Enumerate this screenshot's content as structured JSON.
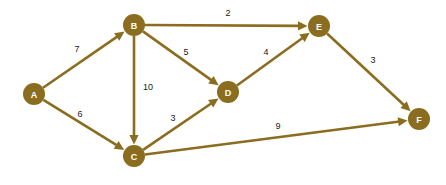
{
  "diagram": {
    "background_color": "#ffffff",
    "node_color": "#8a6d1f",
    "node_label_color": "#ffffff",
    "edge_color": "#8a6d1f",
    "weight_label_color": "#1a1a1a",
    "node_radius": 11,
    "edge_width": 2.6,
    "nodes": [
      {
        "id": "A",
        "label": "A",
        "x": 34,
        "y": 94
      },
      {
        "id": "B",
        "label": "B",
        "x": 134,
        "y": 25
      },
      {
        "id": "C",
        "label": "C",
        "x": 134,
        "y": 156
      },
      {
        "id": "D",
        "label": "D",
        "x": 228,
        "y": 92
      },
      {
        "id": "E",
        "label": "E",
        "x": 319,
        "y": 26
      },
      {
        "id": "F",
        "label": "F",
        "x": 419,
        "y": 119
      }
    ],
    "edges": [
      {
        "id": "A-B",
        "from": "A",
        "to": "B",
        "weight": "7",
        "directed": true,
        "label_x": 77,
        "label_y": 49
      },
      {
        "id": "A-C",
        "from": "A",
        "to": "C",
        "weight": "6",
        "directed": true,
        "label_x": 80,
        "label_y": 114
      },
      {
        "id": "B-C",
        "from": "B",
        "to": "C",
        "weight": "10",
        "directed": true,
        "label_x": 148,
        "label_y": 87
      },
      {
        "id": "B-D",
        "from": "B",
        "to": "D",
        "weight": "5",
        "directed": true,
        "label_x": 186,
        "label_y": 52
      },
      {
        "id": "B-E",
        "from": "B",
        "to": "E",
        "weight": "2",
        "directed": true,
        "label_x": 228,
        "label_y": 13
      },
      {
        "id": "C-D",
        "from": "C",
        "to": "D",
        "weight": "3",
        "directed": true,
        "label_x": 173,
        "label_y": 118
      },
      {
        "id": "C-F",
        "from": "C",
        "to": "F",
        "weight": "9",
        "directed": true,
        "label_x": 278,
        "label_y": 126
      },
      {
        "id": "D-E",
        "from": "D",
        "to": "E",
        "weight": "4",
        "directed": true,
        "label_x": 266,
        "label_y": 52
      },
      {
        "id": "E-F",
        "from": "E",
        "to": "F",
        "weight": "3",
        "directed": true,
        "label_x": 373,
        "label_y": 60
      }
    ]
  }
}
